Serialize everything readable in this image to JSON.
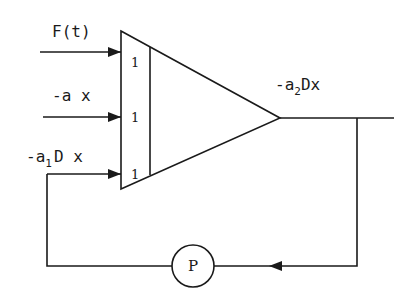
{
  "diagram": {
    "type": "analog-computer-block-diagram",
    "summer": {
      "inputs": [
        {
          "label": "F(t)",
          "gain": "1"
        },
        {
          "label": "-a x",
          "gain": "1"
        },
        {
          "label_main": "-a",
          "label_sub": "1",
          "label_tail": "D x",
          "gain": "1"
        }
      ]
    },
    "output": {
      "label_main": "-a",
      "label_sub": "2",
      "label_tail": "Dx"
    },
    "feedback": {
      "potentiometer_label": "P"
    },
    "colors": {
      "line": "#1a1a1a",
      "background": "#ffffff"
    }
  }
}
